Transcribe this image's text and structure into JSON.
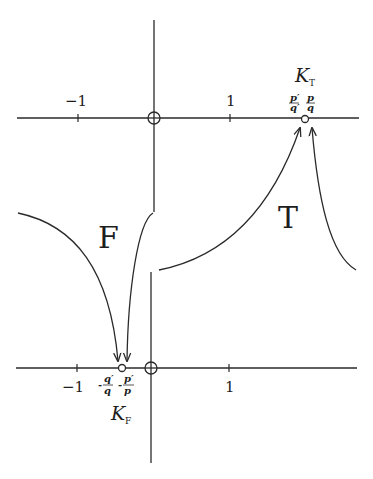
{
  "diagram": {
    "top_panel": {
      "name": "T plane",
      "tick_labels": [
        "−1",
        "1"
      ],
      "point_label": "K",
      "point_label_sub": "T",
      "fraction_labels": [
        {
          "num": "p′",
          "den": "q′"
        },
        {
          "num": "p",
          "den": "q"
        }
      ],
      "region_label": "T"
    },
    "bottom_panel": {
      "name": "F plane",
      "tick_labels": [
        "−1",
        "1"
      ],
      "point_label": "K",
      "point_label_sub": "F",
      "fraction_labels": [
        {
          "sign": "-",
          "num": "q′",
          "den": "q"
        },
        {
          "sign": "-",
          "num": "p′",
          "den": "p"
        }
      ],
      "region_label": "F"
    },
    "colors": {
      "ink": "#2a2a2a",
      "background": "#ffffff"
    }
  }
}
